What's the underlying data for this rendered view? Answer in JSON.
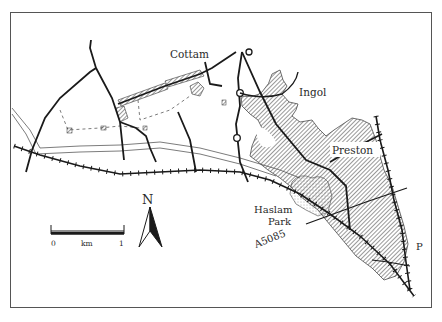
{
  "map": {
    "labels": {
      "cottam": "Cottam",
      "ingol": "Ingol",
      "preston": "Preston",
      "haslam_park_line1": "Haslam",
      "haslam_park_line2": "Park",
      "road": "A5085",
      "p": "P"
    },
    "scale_bar": {
      "start": "0",
      "unit": "km",
      "end": "1"
    },
    "north_arrow": {
      "label": "N"
    },
    "colors": {
      "ink": "#1a1a1a",
      "frame": "#555555",
      "background": "#ffffff"
    }
  }
}
